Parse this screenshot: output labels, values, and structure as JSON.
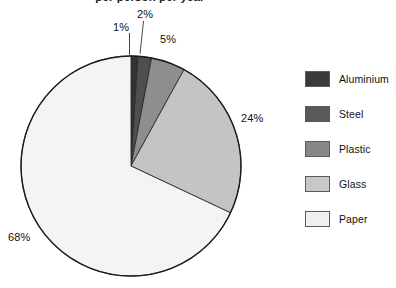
{
  "chart_data": {
    "type": "pie",
    "title": "per person per year",
    "title_clipped": true,
    "categories": [
      "Aluminium",
      "Steel",
      "Plastic",
      "Glass",
      "Paper"
    ],
    "values": [
      1,
      2,
      5,
      24,
      68
    ],
    "value_labels": [
      "1%",
      "2%",
      "5%",
      "24%",
      "68%"
    ],
    "unit": "%",
    "colors": [
      "#333333",
      "#4f4f4f",
      "#8e8e8e",
      "#c4c4c4",
      "#f4f4f4"
    ],
    "start_angle": 0,
    "direction": "clockwise",
    "legend_position": "right",
    "grid": false,
    "xlabel": "",
    "ylabel": ""
  },
  "title": {
    "text": "per person per year"
  },
  "labels": {
    "aluminium": "1%",
    "steel": "2%",
    "plastic": "5%",
    "glass": "24%",
    "paper": "68%"
  },
  "legend": {
    "items": [
      {
        "label": "Aluminium",
        "color": "#3a3a3a"
      },
      {
        "label": "Steel",
        "color": "#595959"
      },
      {
        "label": "Plastic",
        "color": "#878787"
      },
      {
        "label": "Glass",
        "color": "#c8c8c8"
      },
      {
        "label": "Paper",
        "color": "#f0f0f0"
      }
    ]
  }
}
